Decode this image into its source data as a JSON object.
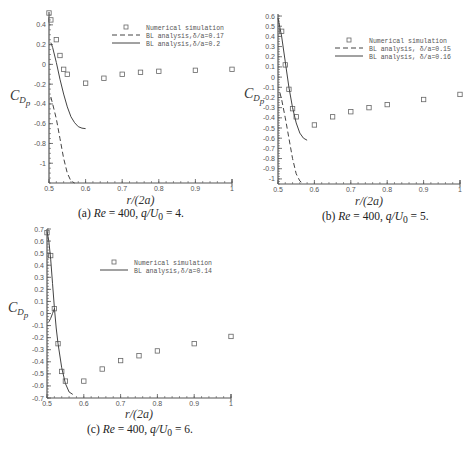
{
  "chart_data": [
    {
      "id": "a",
      "type": "scatter",
      "caption": {
        "label": "(a)",
        "re_text": "Re",
        "re_value": "= 400,",
        "q_text": "q/U",
        "q_sub": "0",
        "q_value": "= 4."
      },
      "xlabel": "r/(2a)",
      "ylabel": "C_Dp",
      "xlim": [
        0.5,
        1.0
      ],
      "ylim": [
        -1.2,
        0.53
      ],
      "xticks": [
        0.5,
        0.6,
        0.7,
        0.8,
        0.9,
        1
      ],
      "xtick_labels": [
        "0.5",
        "0.6",
        "0.7",
        "0.8",
        "0.9",
        "1"
      ],
      "yticks": [
        0.4,
        0.2,
        0,
        -0.2,
        -0.4,
        -0.6,
        -0.8,
        -1
      ],
      "ytick_labels": [
        "0.4",
        "0.2",
        "0",
        "-0.2",
        "-0.4",
        "-0.6",
        "-0.8",
        "-1"
      ],
      "legend": [
        {
          "label": "Numerical simulation",
          "style": "square"
        },
        {
          "label": "BL analysis,δ/a=0.17",
          "style": "dashed"
        },
        {
          "label": "BL analysis,δ/a=0.2",
          "style": "solid"
        }
      ],
      "series": [
        {
          "name": "Numerical simulation",
          "style": "square",
          "x": [
            0.5,
            0.505,
            0.52,
            0.53,
            0.54,
            0.55,
            0.6,
            0.65,
            0.7,
            0.75,
            0.8,
            0.9,
            1.0
          ],
          "y": [
            0.52,
            0.45,
            0.25,
            0.09,
            -0.05,
            -0.1,
            -0.19,
            -0.14,
            -0.1,
            -0.08,
            -0.07,
            -0.06,
            -0.05
          ]
        },
        {
          "name": "BL analysis,δ/a=0.17",
          "style": "dashed",
          "x": [
            0.505,
            0.51,
            0.52,
            0.53,
            0.54,
            0.55,
            0.56,
            0.57
          ],
          "y": [
            -0.33,
            -0.4,
            -0.55,
            -0.75,
            -0.95,
            -1.1,
            -1.18,
            -1.2
          ]
        },
        {
          "name": "BL analysis,δ/a=0.2",
          "style": "solid",
          "x": [
            0.505,
            0.51,
            0.52,
            0.53,
            0.54,
            0.55,
            0.56,
            0.57,
            0.58,
            0.59,
            0.6
          ],
          "y": [
            0.22,
            0.17,
            0.02,
            -0.15,
            -0.3,
            -0.43,
            -0.53,
            -0.59,
            -0.63,
            -0.645,
            -0.65
          ]
        }
      ]
    },
    {
      "id": "b",
      "type": "scatter",
      "caption": {
        "label": "(b)",
        "re_text": "Re",
        "re_value": "= 400,",
        "q_text": "q/U",
        "q_sub": "0",
        "q_value": "= 5."
      },
      "xlabel": "r/(2a)",
      "ylabel": "C_Dp",
      "xlim": [
        0.5,
        1.0
      ],
      "ylim": [
        -1.05,
        0.62
      ],
      "xticks": [
        0.5,
        0.6,
        0.7,
        0.8,
        0.9,
        1
      ],
      "xtick_labels": [
        "0.5",
        "0.6",
        "0.7",
        "0.8",
        "0.9",
        "1"
      ],
      "yticks": [
        0.6,
        0.5,
        0.4,
        0.3,
        0.2,
        0.1,
        0,
        -0.1,
        -0.2,
        -0.3,
        -0.4,
        -0.5,
        -0.6,
        -0.7,
        -0.8,
        -0.9,
        -1
      ],
      "ytick_labels": [
        "0.6",
        "0.5",
        "0.4",
        "0.3",
        "0.2",
        "0.1",
        "0",
        "-0.1",
        "-0.2",
        "-0.3",
        "-0.4",
        "-0.5",
        "-0.6",
        "-0.7",
        "-0.8",
        "-0.9",
        "-1"
      ],
      "legend": [
        {
          "label": "Numerical simulation",
          "style": "square"
        },
        {
          "label": "BL analysis, δ/a=0.15",
          "style": "dashed"
        },
        {
          "label": "BL analysis, δ/a=0.16",
          "style": "solid"
        }
      ],
      "series": [
        {
          "name": "Numerical simulation",
          "style": "square",
          "x": [
            0.51,
            0.52,
            0.53,
            0.54,
            0.55,
            0.6,
            0.65,
            0.7,
            0.75,
            0.8,
            0.9,
            1.0
          ],
          "y": [
            0.45,
            0.12,
            -0.12,
            -0.31,
            -0.39,
            -0.47,
            -0.39,
            -0.34,
            -0.3,
            -0.27,
            -0.22,
            -0.17
          ]
        },
        {
          "name": "BL analysis, δ/a=0.15",
          "style": "dashed",
          "x": [
            0.505,
            0.51,
            0.52,
            0.53,
            0.54,
            0.55,
            0.56,
            0.57
          ],
          "y": [
            -0.15,
            -0.22,
            -0.4,
            -0.6,
            -0.8,
            -0.95,
            -1.02,
            -1.05
          ]
        },
        {
          "name": "BL analysis, δ/a=0.16",
          "style": "solid",
          "x": [
            0.5,
            0.51,
            0.52,
            0.53,
            0.54,
            0.55,
            0.56,
            0.57,
            0.58
          ],
          "y": [
            0.58,
            0.4,
            0.15,
            -0.1,
            -0.3,
            -0.45,
            -0.55,
            -0.6,
            -0.62
          ]
        }
      ]
    },
    {
      "id": "c",
      "type": "scatter",
      "caption": {
        "label": "(c)",
        "re_text": "Re",
        "re_value": "= 400,",
        "q_text": "q/U",
        "q_sub": "0",
        "q_value": "= 6."
      },
      "xlabel": "r/(2a)",
      "ylabel": "C_Dp",
      "xlim": [
        0.5,
        1.0
      ],
      "ylim": [
        -0.7,
        0.7
      ],
      "xticks": [
        0.5,
        0.6,
        0.7,
        0.8,
        0.9,
        1
      ],
      "xtick_labels": [
        "0.5",
        "0.6",
        "0.7",
        "0.8",
        "0.9",
        "1"
      ],
      "yticks": [
        0.7,
        0.6,
        0.5,
        0.4,
        0.3,
        0.2,
        0.1,
        0,
        -0.1,
        -0.2,
        -0.3,
        -0.4,
        -0.5,
        -0.6,
        -0.7
      ],
      "ytick_labels": [
        "0.7",
        "0.6",
        "0.5",
        "0.4",
        "0.3",
        "0.2",
        "0.1",
        "0",
        "-0.1",
        "-0.2",
        "-0.3",
        "-0.4",
        "-0.5",
        "-0.6",
        "-0.7"
      ],
      "legend": [
        {
          "label": "Numerical simulation",
          "style": "square"
        },
        {
          "label": "BL analysis,δ/a=0.14",
          "style": "solid"
        }
      ],
      "series": [
        {
          "name": "Numerical simulation",
          "style": "square",
          "x": [
            0.5,
            0.51,
            0.52,
            0.53,
            0.54,
            0.55,
            0.6,
            0.65,
            0.7,
            0.75,
            0.8,
            0.9,
            1.0
          ],
          "y": [
            0.67,
            0.48,
            0.04,
            -0.25,
            -0.48,
            -0.56,
            -0.56,
            -0.46,
            -0.39,
            -0.35,
            -0.31,
            -0.25,
            -0.19
          ]
        },
        {
          "name": "BL analysis,δ/a=0.14",
          "style": "solid",
          "x": [
            0.5,
            0.505,
            0.51,
            0.515,
            0.52,
            0.525,
            0.53,
            0.54,
            0.55,
            0.56,
            0.57
          ],
          "y": [
            0.68,
            0.6,
            0.45,
            0.25,
            0.05,
            -0.12,
            -0.25,
            -0.45,
            -0.58,
            -0.65,
            -0.67
          ]
        },
        {
          "name": "BL analysis branch",
          "style": "solid",
          "x": [
            0.505,
            0.51,
            0.515,
            0.52
          ],
          "y": [
            -0.07,
            -0.04,
            0.0,
            0.04
          ]
        }
      ]
    }
  ],
  "layout": [
    {
      "left": 49,
      "right": 232,
      "top": 12,
      "bottom": 183,
      "ylabel_x": 10,
      "ylabel_y": 100,
      "legend_x": 112,
      "legend_y": 27,
      "xlabel_y": 204,
      "caption_x": 78,
      "caption_y": 207
    },
    {
      "left": 278,
      "right": 460,
      "top": 14,
      "bottom": 184,
      "ylabel_x": 244,
      "ylabel_y": 98,
      "legend_x": 335,
      "legend_y": 40,
      "xlabel_y": 205,
      "caption_x": 322,
      "caption_y": 210
    },
    {
      "left": 47,
      "right": 231,
      "top": 229,
      "bottom": 398,
      "ylabel_x": 8,
      "ylabel_y": 312,
      "legend_x": 100,
      "legend_y": 262,
      "xlabel_y": 418,
      "caption_x": 87,
      "caption_y": 423
    }
  ]
}
